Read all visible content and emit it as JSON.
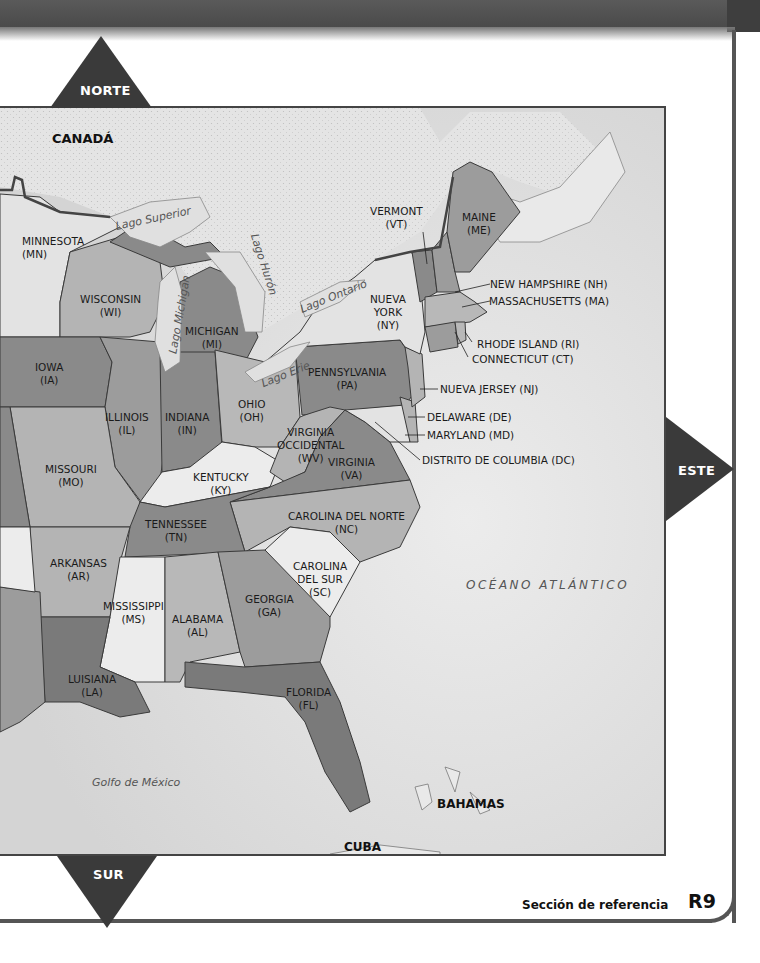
{
  "compass": {
    "north": "NORTE",
    "south": "SUR",
    "east": "ESTE"
  },
  "countries": {
    "canada": "CANADÁ",
    "cuba": "CUBA",
    "bahamas": "BAHAMAS"
  },
  "water": {
    "lake_superior": "Lago Superior",
    "lake_michigan": "Lago Michigan",
    "lake_huron": "Lago Hurón",
    "lake_ontario": "Lago Ontario",
    "lake_erie": "Lago Erie",
    "gulf_of_mexico": "Golfo de México",
    "atlantic_ocean": "OCÉANO ATLÁNTICO"
  },
  "states": {
    "mn": {
      "name": "MINNESOTA",
      "abbr": "(MN)"
    },
    "wi": {
      "name": "WISCONSIN",
      "abbr": "(WI)"
    },
    "mi": {
      "name": "MICHIGAN",
      "abbr": "(MI)"
    },
    "ia": {
      "name": "IOWA",
      "abbr": "(IA)"
    },
    "il": {
      "name": "ILLINOIS",
      "abbr": "(IL)"
    },
    "in": {
      "name": "INDIANA",
      "abbr": "(IN)"
    },
    "oh": {
      "name": "OHIO",
      "abbr": "(OH)"
    },
    "mo": {
      "name": "MISSOURI",
      "abbr": "(MO)"
    },
    "ky": {
      "name": "KENTUCKY",
      "abbr": "(KY)"
    },
    "wv": {
      "name1": "VIRGINIA",
      "name2": "OCCIDENTAL",
      "abbr": "(WV)"
    },
    "va": {
      "name": "VIRGINIA",
      "abbr": "(VA)"
    },
    "tn": {
      "name": "TENNESSEE",
      "abbr": "(TN)"
    },
    "nc": {
      "name": "CAROLINA DEL NORTE",
      "abbr": "(NC)"
    },
    "ar": {
      "name": "ARKANSAS",
      "abbr": "(AR)"
    },
    "sc": {
      "name1": "CAROLINA",
      "name2": "DEL SUR",
      "abbr": "(SC)"
    },
    "ms": {
      "name": "MISSISSIPPI",
      "abbr": "(MS)"
    },
    "al": {
      "name": "ALABAMA",
      "abbr": "(AL)"
    },
    "ga": {
      "name": "GEORGIA",
      "abbr": "(GA)"
    },
    "la": {
      "name": "LUISIANA",
      "abbr": "(LA)"
    },
    "fl": {
      "name": "FLORIDA",
      "abbr": "(FL)"
    },
    "pa": {
      "name": "PENNSYLVANIA",
      "abbr": "(PA)"
    },
    "ny": {
      "name1": "NUEVA",
      "name2": "YORK",
      "abbr": "(NY)"
    },
    "vt": {
      "name": "VERMONT",
      "abbr": "(VT)"
    },
    "me": {
      "name": "MAINE",
      "abbr": "(ME)"
    },
    "nh": {
      "label": "NEW HAMPSHIRE (NH)"
    },
    "ma": {
      "label": "MASSACHUSETTS (MA)"
    },
    "ri": {
      "label": "RHODE ISLAND (RI)"
    },
    "ct": {
      "label": "CONNECTICUT (CT)"
    },
    "nj": {
      "label": "NUEVA JERSEY (NJ)"
    },
    "de": {
      "label": "DELAWARE (DE)"
    },
    "md": {
      "label": "MARYLAND (MD)"
    },
    "dc": {
      "label": "DISTRITO DE COLUMBIA (DC)"
    }
  },
  "footer": {
    "section": "Sección de referencia",
    "page": "R9"
  },
  "colors": {
    "dark": "#7a7a7a",
    "medium": "#9c9c9c",
    "light": "#b8b8b8",
    "lighter": "#e3e3e3",
    "water": "#dedede",
    "canada": "#e6e6e6",
    "border": "#3a3a3a",
    "compass": "#3a3a3a"
  }
}
